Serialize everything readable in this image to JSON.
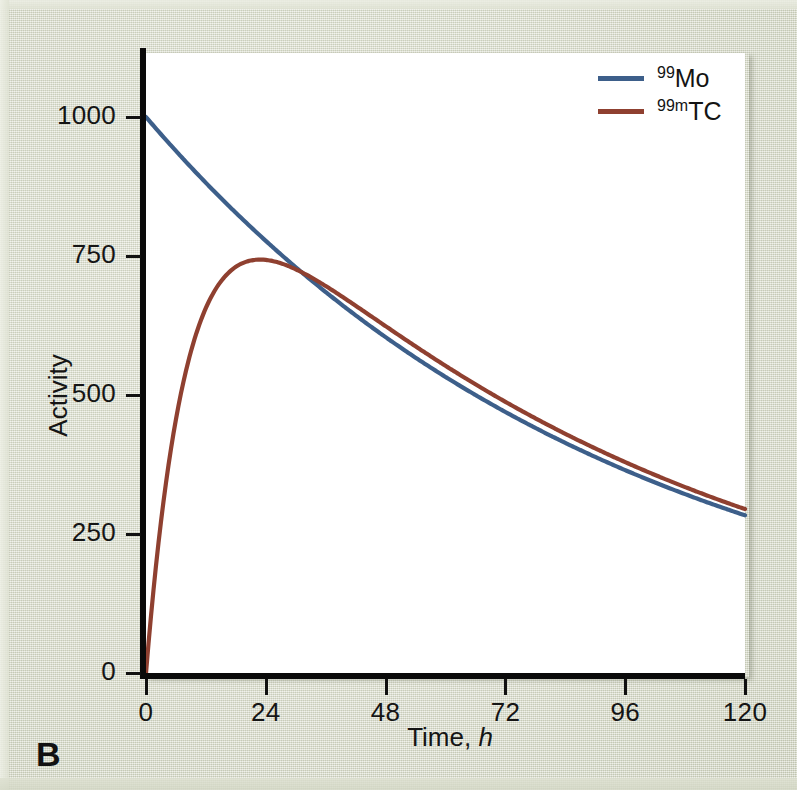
{
  "panel": {
    "label": "B"
  },
  "colors": {
    "background": "#dde0d0",
    "plot_background": "#ffffff",
    "axis": "#0a0a0a",
    "mo99": "#3d5f8a",
    "tc99m": "#8f4030",
    "text": "#151515"
  },
  "axes": {
    "x_label_prefix": "Time, ",
    "x_label_italic": "h",
    "y_label": "Activity",
    "x_ticks": [
      "0",
      "24",
      "48",
      "72",
      "96",
      "120"
    ],
    "y_ticks": [
      "0",
      "250",
      "500",
      "750",
      "1000"
    ]
  },
  "legend": {
    "items": [
      {
        "mass": "99",
        "meta": "",
        "symbol": "Mo",
        "color": "#3d5f8a"
      },
      {
        "mass": "99",
        "meta": "m",
        "symbol": "TC",
        "color": "#8f4030"
      }
    ]
  },
  "chart_data": {
    "type": "line",
    "title": "",
    "xlabel": "Time, h",
    "ylabel": "Activity",
    "xlim": [
      0,
      120
    ],
    "ylim": [
      0,
      1000
    ],
    "xticks": [
      0,
      24,
      48,
      72,
      96,
      120
    ],
    "yticks": [
      0,
      250,
      500,
      750,
      1000
    ],
    "grid": false,
    "legend_position": "top-right",
    "annotations": [
      "B"
    ],
    "x": [
      0,
      2,
      4,
      6,
      8,
      10,
      12,
      16,
      20,
      22,
      24,
      28,
      32,
      36,
      40,
      48,
      56,
      64,
      72,
      80,
      88,
      96,
      104,
      112,
      120
    ],
    "series": [
      {
        "name": "99Mo",
        "color": "#3d5f8a",
        "half_life_h": 66,
        "values": [
          1000,
          979,
          959,
          939,
          919,
          900,
          881,
          845,
          810,
          793,
          777,
          745,
          714,
          685,
          657,
          604,
          555,
          511,
          470,
          432,
          397,
          365,
          336,
          309,
          284
        ]
      },
      {
        "name": "99mTC",
        "color": "#8f4030",
        "half_life_h": 6,
        "values": [
          0,
          203,
          359,
          478,
          569,
          638,
          690,
          757,
          788,
          794,
          797,
          791,
          775,
          754,
          730,
          678,
          626,
          577,
          531,
          488,
          448,
          412,
          379,
          348,
          320
        ]
      }
    ]
  }
}
